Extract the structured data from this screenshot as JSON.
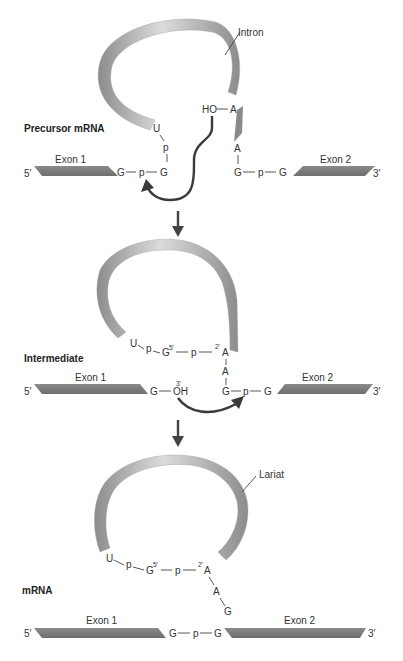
{
  "stages": [
    {
      "label": "Precursor mRNA",
      "exon1": {
        "label": "Exon 1",
        "end5": "5′",
        "boundary": "G"
      },
      "exon2": {
        "label": "Exon 2",
        "end3": "3′",
        "boundary": "G"
      },
      "intron_label": "Intron",
      "five_splice": {
        "p": "p",
        "g": "G",
        "p2": "p",
        "u": "U"
      },
      "branch": {
        "ho": "HO",
        "a_top": "A",
        "a_bottom": "A"
      },
      "three_splice": {
        "g1": "G",
        "p": "p",
        "g2": "G"
      }
    },
    {
      "label": "Intermediate",
      "exon1": {
        "label": "Exon 1",
        "end5": "5′",
        "boundary": "G",
        "oh": "OH",
        "oh_sup": "3′"
      },
      "exon2": {
        "label": "Exon 2",
        "end3": "3′"
      },
      "loop": {
        "u": "U",
        "p1": "p",
        "g": "G",
        "g_sup": "5′",
        "p2": "p",
        "a_sup": "2′",
        "a": "A",
        "a2": "A"
      },
      "three_splice": {
        "g1": "G",
        "p": "p",
        "g2": "G"
      }
    },
    {
      "label": "mRNA",
      "lariat_label": "Lariat",
      "loop": {
        "u": "U",
        "p1": "p",
        "g": "G",
        "g_sup": "5′",
        "p2": "p",
        "a_sup": "2′",
        "a": "A",
        "a2": "A",
        "g_tail": "G"
      },
      "exon1": {
        "label": "Exon 1",
        "end5": "5′"
      },
      "exon2": {
        "label": "Exon 2",
        "end3": "3′"
      },
      "junction": {
        "g1": "G",
        "p": "p",
        "g2": "G"
      }
    }
  ],
  "colors": {
    "exon": "#7a7a7a",
    "intron_light": "#d0d0d0",
    "intron_dark": "#8a8a8a",
    "arrow": "#3a3a3a"
  }
}
